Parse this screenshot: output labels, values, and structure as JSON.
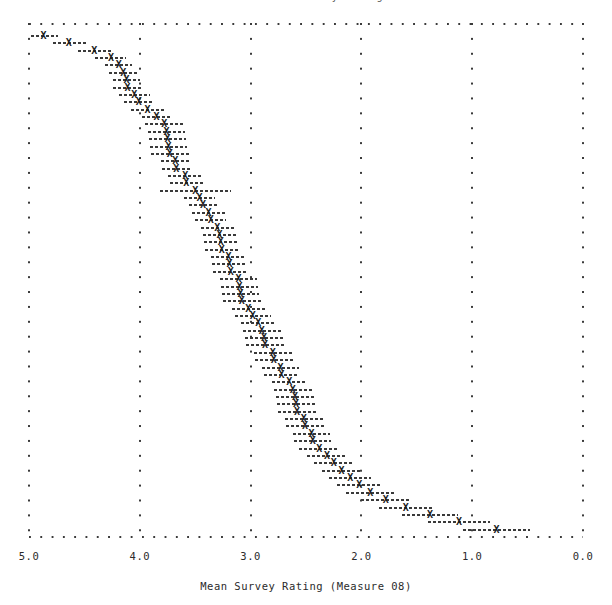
{
  "chart_data": {
    "type": "scatter",
    "subtitle": "",
    "xlabel": "Mean Survey Rating (Measure 08)",
    "ylabel": "",
    "xlim": [
      5.0,
      0.0
    ],
    "ylim": [
      0,
      68
    ],
    "x_axis_reversed": true,
    "grid": true,
    "grid_style": "dotted",
    "legend": null,
    "marker": "X",
    "error_bar_style": "dashed-horizontal",
    "xticks": [
      5.0,
      4.0,
      3.0,
      2.0,
      1.0,
      0.0
    ],
    "xticklabels": [
      "5.0",
      "4.0",
      "3.0",
      "2.0",
      "1.0",
      "0.0"
    ],
    "yticks": [],
    "yticklabels": [],
    "n_points": 68,
    "series": [
      {
        "name": "Mean Survey Rating (Measure 08)",
        "x": [
          4.87,
          4.64,
          4.41,
          4.26,
          4.19,
          4.15,
          4.12,
          4.11,
          4.05,
          4.01,
          3.93,
          3.85,
          3.78,
          3.76,
          3.75,
          3.74,
          3.73,
          3.68,
          3.67,
          3.59,
          3.58,
          3.5,
          3.46,
          3.43,
          3.38,
          3.36,
          3.3,
          3.28,
          3.27,
          3.26,
          3.2,
          3.19,
          3.18,
          3.11,
          3.1,
          3.09,
          3.08,
          3.02,
          2.98,
          2.93,
          2.9,
          2.88,
          2.87,
          2.8,
          2.79,
          2.73,
          2.72,
          2.65,
          2.62,
          2.6,
          2.59,
          2.58,
          2.52,
          2.51,
          2.45,
          2.44,
          2.38,
          2.31,
          2.25,
          2.18,
          2.1,
          2.02,
          1.92,
          1.78,
          1.6,
          1.38,
          1.12,
          0.78
        ],
        "x_low": [
          4.98,
          4.78,
          4.56,
          4.4,
          4.31,
          4.28,
          4.24,
          4.24,
          4.19,
          4.14,
          4.08,
          3.98,
          3.95,
          3.93,
          3.92,
          3.91,
          3.9,
          3.81,
          3.8,
          3.75,
          3.73,
          3.82,
          3.6,
          3.56,
          3.53,
          3.5,
          3.45,
          3.43,
          3.42,
          3.41,
          3.36,
          3.35,
          3.34,
          3.28,
          3.27,
          3.26,
          3.25,
          3.17,
          3.14,
          3.09,
          3.07,
          3.05,
          3.04,
          2.97,
          2.96,
          2.9,
          2.88,
          2.81,
          2.79,
          2.77,
          2.76,
          2.75,
          2.69,
          2.68,
          2.62,
          2.61,
          2.56,
          2.49,
          2.43,
          2.36,
          2.29,
          2.22,
          2.14,
          2.0,
          1.84,
          1.63,
          1.4,
          1.08
        ],
        "x_high": [
          4.74,
          4.49,
          4.26,
          4.12,
          4.07,
          4.02,
          4.0,
          3.98,
          3.91,
          3.88,
          3.78,
          3.72,
          3.61,
          3.59,
          3.58,
          3.57,
          3.56,
          3.55,
          3.54,
          3.43,
          3.43,
          3.18,
          3.32,
          3.3,
          3.23,
          3.22,
          3.15,
          3.13,
          3.12,
          3.11,
          3.04,
          3.03,
          3.02,
          2.94,
          2.93,
          2.92,
          2.91,
          2.87,
          2.82,
          2.77,
          2.73,
          2.71,
          2.7,
          2.63,
          2.62,
          2.56,
          2.56,
          2.49,
          2.45,
          2.43,
          2.42,
          2.41,
          2.35,
          2.34,
          2.28,
          2.27,
          2.2,
          2.13,
          2.07,
          2.0,
          1.91,
          1.82,
          1.7,
          1.56,
          1.36,
          1.13,
          0.84,
          0.48
        ]
      }
    ]
  },
  "axis": {
    "x_label": "Mean Survey Rating (Measure 08)",
    "ticks": [
      {
        "value": "5.0"
      },
      {
        "value": "4.0"
      },
      {
        "value": "3.0"
      },
      {
        "value": "2.0"
      },
      {
        "value": "1.0"
      },
      {
        "value": "0.0"
      }
    ]
  },
  "title": {
    "text": "Ranked Mean Survey Ratings"
  },
  "marker_glyph": "X",
  "colors": {
    "ink": "#2b2b2b",
    "marker": "#1c1c1c",
    "grid": "#3a3a3a",
    "background": "#ffffff"
  }
}
